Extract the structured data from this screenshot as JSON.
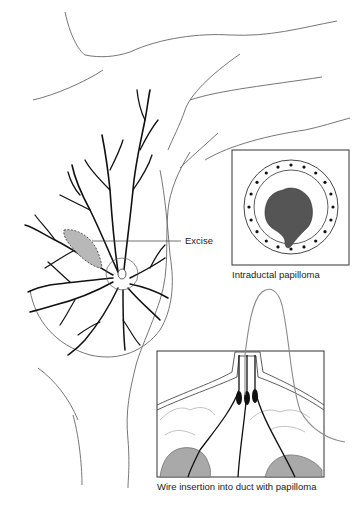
{
  "figure": {
    "labels": {
      "excise": "Excise",
      "inset_top_caption": "Intraductal papilloma",
      "inset_bottom_caption": "Wire insertion into duct with papilloma"
    },
    "colors": {
      "outline": "#555555",
      "duct": "#111111",
      "lesion_fill": "#555555",
      "shaded_area": "#b8b8b8",
      "tissue_fill": "#a9a9a9",
      "wire": "#8a8a8a"
    }
  }
}
